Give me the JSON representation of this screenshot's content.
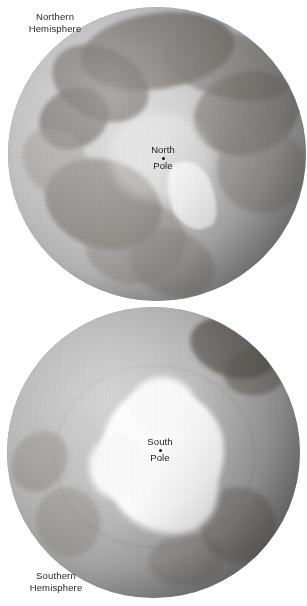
{
  "figure": {
    "background_color": "#ffffff",
    "caption_color": "#262626"
  },
  "northern": {
    "hemisphere_label": "Northern\nHemisphere",
    "pole_name": "North",
    "pole_word": "Pole",
    "globe_name": "earth-globe-north-polar-view",
    "ocean_color": "#cfcfcf",
    "land_color": "#5c5854",
    "ice_color": "#fdfdfd"
  },
  "southern": {
    "hemisphere_label": "Southern\nHemisphere",
    "pole_name": "South",
    "pole_word": "Pole",
    "globe_name": "earth-globe-south-polar-view",
    "ocean_color": "#bdbdbd",
    "land_color": "#4e4a46",
    "ice_color": "#ffffff"
  }
}
